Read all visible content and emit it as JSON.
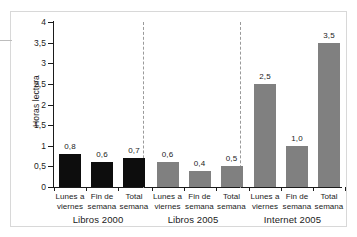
{
  "chart_data": {
    "type": "bar",
    "title": "",
    "subtitle": "",
    "xlabel": "",
    "ylabel": "Horas lectura",
    "ylim": [
      0,
      4
    ],
    "ytick_labels": [
      "0",
      "0,5",
      "1",
      "1,5",
      "2",
      "2,5",
      "3",
      "3,5",
      "4"
    ],
    "ytick_values": [
      0,
      0.5,
      1,
      1.5,
      2,
      2.5,
      3,
      3.5,
      4
    ],
    "grid": false,
    "legend": "none",
    "categories": [
      "Lunes a viernes",
      "Fin de semana",
      "Total semana",
      "Lunes a viernes",
      "Fin de semana",
      "Total semana",
      "Lunes a viernes",
      "Fin de semana",
      "Total semana"
    ],
    "values": [
      0.8,
      0.6,
      0.7,
      0.6,
      0.4,
      0.5,
      2.5,
      1.0,
      3.5
    ],
    "value_labels": [
      "0,8",
      "0,6",
      "0,7",
      "0,6",
      "0,4",
      "0,5",
      "2,5",
      "1,0",
      "3,5"
    ],
    "groups": [
      {
        "name": "Libros 2000",
        "color": "#0d0d0d",
        "categories": [
          "Lunes a viernes",
          "Fin de semana",
          "Total semana"
        ],
        "values": [
          0.8,
          0.6,
          0.7
        ],
        "value_labels": [
          "0,8",
          "0,6",
          "0,7"
        ]
      },
      {
        "name": "Libros 2005",
        "color": "#808080",
        "categories": [
          "Lunes a viernes",
          "Fin de semana",
          "Total semana"
        ],
        "values": [
          0.6,
          0.4,
          0.5
        ],
        "value_labels": [
          "0,6",
          "0,4",
          "0,5"
        ]
      },
      {
        "name": "Internet 2005",
        "color": "#808080",
        "categories": [
          "Lunes a viernes",
          "Fin de semana",
          "Total semana"
        ],
        "values": [
          2.5,
          1.0,
          3.5
        ],
        "value_labels": [
          "2,5",
          "1,0",
          "3,5"
        ]
      }
    ]
  },
  "axis": {
    "y_label": "Horas lectura",
    "ticks": [
      {
        "label": "4"
      },
      {
        "label": "3,5"
      },
      {
        "label": "3"
      },
      {
        "label": "2,5"
      },
      {
        "label": "2"
      },
      {
        "label": "1,5"
      },
      {
        "label": "1"
      },
      {
        "label": "0,5"
      },
      {
        "label": "0"
      }
    ]
  },
  "bars": [
    {
      "value_label": "0,8",
      "line1": "Lunes a",
      "line2": "viernes"
    },
    {
      "value_label": "0,6",
      "line1": "Fin de",
      "line2": "semana"
    },
    {
      "value_label": "0,7",
      "line1": "Total",
      "line2": "semana"
    },
    {
      "value_label": "0,6",
      "line1": "Lunes a",
      "line2": "viernes"
    },
    {
      "value_label": "0,4",
      "line1": "Fin de",
      "line2": "semana"
    },
    {
      "value_label": "0,5",
      "line1": "Total",
      "line2": "semana"
    },
    {
      "value_label": "2,5",
      "line1": "Lunes a",
      "line2": "viernes"
    },
    {
      "value_label": "1,0",
      "line1": "Fin de",
      "line2": "semana"
    },
    {
      "value_label": "3,5",
      "line1": "Total",
      "line2": "semana"
    }
  ],
  "group_labels": [
    {
      "label": "Libros 2000"
    },
    {
      "label": "Libros 2005"
    },
    {
      "label": "Internet 2005"
    }
  ],
  "colors": {
    "bar_dark": "#0d0d0d",
    "bar_gray": "#808080",
    "axis": "#1b1b1b",
    "separator": "#9a9a9a",
    "frame": "#d8d8d8"
  }
}
